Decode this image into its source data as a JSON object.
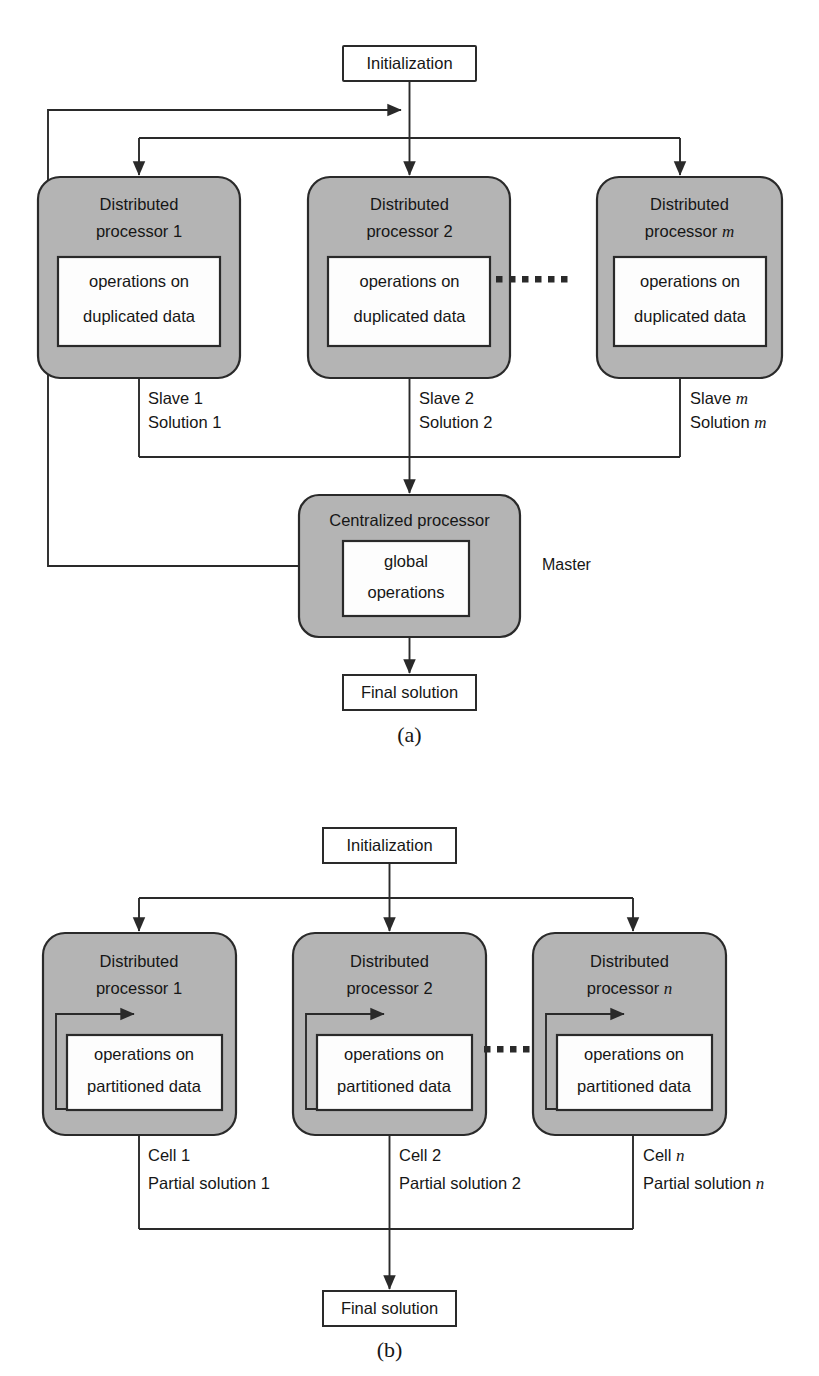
{
  "figure": {
    "type": "block-diagram",
    "background": "#ffffff",
    "colors": {
      "processor_fill": "#b4b4b4",
      "inner_fill": "#fdfdfd",
      "plain_fill": "#ffffff",
      "stroke": "#2a2a2a",
      "text": "#161616"
    },
    "ellipsis_glyph": "......"
  },
  "panel_a": {
    "caption": "(a)",
    "init_box": {
      "label": "Initialization"
    },
    "processors": [
      {
        "title_line1": "Distributed",
        "title_line2": "processor 1",
        "index": "1",
        "index_italic": false,
        "inner_line1": "operations on",
        "inner_line2": "duplicated data",
        "out_label_line1": "Slave 1",
        "out_label_line2": "Solution 1",
        "out_index": "1",
        "out_index_italic": false
      },
      {
        "title_line1": "Distributed",
        "title_line2": "processor 2",
        "index": "2",
        "index_italic": false,
        "inner_line1": "operations on",
        "inner_line2": "duplicated data",
        "out_label_line1": "Slave 2",
        "out_label_line2": "Solution 2",
        "out_index": "2",
        "out_index_italic": false
      },
      {
        "title_line1": "Distributed",
        "title_line2": "processor m",
        "index": "m",
        "index_italic": true,
        "inner_line1": "operations on",
        "inner_line2": "duplicated data",
        "out_label_line1": "Slave m",
        "out_label_line2": "Solution m",
        "out_index": "m",
        "out_index_italic": true
      }
    ],
    "central": {
      "title": "Centralized processor",
      "inner_line1": "global",
      "inner_line2": "operations",
      "side_label": "Master"
    },
    "final_box": {
      "label": "Final solution"
    }
  },
  "panel_b": {
    "caption": "(b)",
    "init_box": {
      "label": "Initialization"
    },
    "processors": [
      {
        "title_line1": "Distributed",
        "title_line2": "processor 1",
        "index": "1",
        "index_italic": false,
        "inner_line1": "operations on",
        "inner_line2": "partitioned data",
        "out_label_line1": "Cell 1",
        "out_label_line2": "Partial solution 1",
        "out_index": "1",
        "out_index_italic": false
      },
      {
        "title_line1": "Distributed",
        "title_line2": "processor 2",
        "index": "2",
        "index_italic": false,
        "inner_line1": "operations on",
        "inner_line2": "partitioned data",
        "out_label_line1": "Cell 2",
        "out_label_line2": "Partial solution 2",
        "out_index": "2",
        "out_index_italic": false
      },
      {
        "title_line1": "Distributed",
        "title_line2": "processor n",
        "index": "n",
        "index_italic": true,
        "inner_line1": "operations on",
        "inner_line2": "partitioned data",
        "out_label_line1": "Cell n",
        "out_label_line2": "Partial solution n",
        "out_index": "n",
        "out_index_italic": true
      }
    ],
    "final_box": {
      "label": "Final solution"
    }
  }
}
